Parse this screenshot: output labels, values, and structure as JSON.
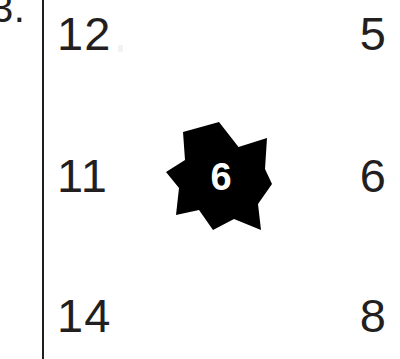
{
  "worksheet": {
    "problem_number": "3.",
    "divider": "vertical-rule",
    "star": {
      "points": 7,
      "fill_color": "#000000",
      "value": "6",
      "value_color": "#ffffff"
    },
    "ink_color": "#231f20",
    "background_color": "#ffffff",
    "rows": [
      {
        "left": "12",
        "right": "5"
      },
      {
        "left": "11",
        "right": "6"
      },
      {
        "left": "14",
        "right": "8"
      }
    ]
  }
}
